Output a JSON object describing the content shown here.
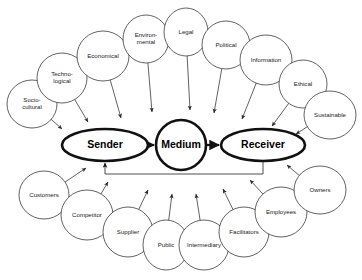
{
  "diagram": {
    "background_color": "#ffffff",
    "node_stroke_color": "#3a3a3a",
    "core_stroke_color": "#111111",
    "label_color": "#1a1a1a",
    "core": {
      "sender": {
        "label": "Sender",
        "cx": 105,
        "cy": 145,
        "rx": 43,
        "ry": 16
      },
      "medium": {
        "label": "Medium",
        "cx": 181,
        "cy": 145,
        "rx": 25,
        "ry": 25
      },
      "receiver": {
        "label": "Receiver",
        "cx": 263,
        "cy": 145,
        "rx": 42,
        "ry": 16
      }
    },
    "upper_arc": {
      "description": "Macro environment factors feeding into the sender and receiver",
      "nodes": [
        {
          "label_lines": [
            "Socio-",
            "cultural"
          ],
          "cx": 32,
          "cy": 104,
          "rx": 25,
          "ry": 24,
          "target_x": 62,
          "target_y": 129
        },
        {
          "label_lines": [
            "Techno-",
            "logical"
          ],
          "cx": 62,
          "cy": 78,
          "rx": 25,
          "ry": 25,
          "target_x": 88,
          "target_y": 122
        },
        {
          "label_lines": [
            "Economical"
          ],
          "cx": 103,
          "cy": 56,
          "rx": 26,
          "ry": 25,
          "target_x": 121,
          "target_y": 118
        },
        {
          "label_lines": [
            "Environ-",
            "mental"
          ],
          "cx": 146,
          "cy": 39,
          "rx": 23,
          "ry": 24,
          "target_x": 152,
          "target_y": 112
        },
        {
          "label_lines": [
            "Legal"
          ],
          "cx": 186,
          "cy": 32,
          "rx": 22,
          "ry": 24,
          "target_x": 190,
          "target_y": 110
        },
        {
          "label_lines": [
            "Political"
          ],
          "cx": 226,
          "cy": 45,
          "rx": 24,
          "ry": 24,
          "target_x": 214,
          "target_y": 113
        },
        {
          "label_lines": [
            "Information"
          ],
          "cx": 266,
          "cy": 60,
          "rx": 26,
          "ry": 25,
          "target_x": 242,
          "target_y": 119
        },
        {
          "label_lines": [
            "Ethical"
          ],
          "cx": 303,
          "cy": 84,
          "rx": 24,
          "ry": 24,
          "target_x": 272,
          "target_y": 126
        },
        {
          "label_lines": [
            "Sustainable"
          ],
          "cx": 330,
          "cy": 115,
          "rx": 26,
          "ry": 24,
          "target_x": 296,
          "target_y": 134
        }
      ]
    },
    "lower_arc": {
      "description": "Stakeholder groups feeding back into the sender and receiver",
      "nodes": [
        {
          "label_lines": [
            "Customers"
          ],
          "cx": 44,
          "cy": 195,
          "rx": 25,
          "ry": 24,
          "target_x": 86,
          "target_y": 168
        },
        {
          "label_lines": [
            "Competitor"
          ],
          "cx": 87,
          "cy": 215,
          "rx": 26,
          "ry": 25,
          "target_x": 108,
          "target_y": 182
        },
        {
          "label_lines": [
            "Supplier"
          ],
          "cx": 128,
          "cy": 232,
          "rx": 25,
          "ry": 25,
          "target_x": 148,
          "target_y": 190
        },
        {
          "label_lines": [
            "Public"
          ],
          "cx": 166,
          "cy": 245,
          "rx": 23,
          "ry": 25,
          "target_x": 172,
          "target_y": 194
        },
        {
          "label_lines": [
            "Intermediary"
          ],
          "cx": 204,
          "cy": 245,
          "rx": 25,
          "ry": 25,
          "target_x": 196,
          "target_y": 194
        },
        {
          "label_lines": [
            "Facilitators"
          ],
          "cx": 244,
          "cy": 232,
          "rx": 25,
          "ry": 25,
          "target_x": 223,
          "target_y": 189
        },
        {
          "label_lines": [
            "Employees"
          ],
          "cx": 281,
          "cy": 212,
          "rx": 26,
          "ry": 25,
          "target_x": 250,
          "target_y": 180
        },
        {
          "label_lines": [
            "Owners"
          ],
          "cx": 320,
          "cy": 190,
          "rx": 26,
          "ry": 24,
          "target_x": 287,
          "target_y": 165
        }
      ]
    },
    "flows": [
      {
        "name": "sender-to-medium",
        "from": "Sender",
        "to": "Medium",
        "x1": 149,
        "y1": 145,
        "x2": 154,
        "y2": 145
      },
      {
        "name": "medium-to-receiver",
        "from": "Medium",
        "to": "Receiver",
        "x1": 207,
        "y1": 145,
        "x2": 219,
        "y2": 145
      }
    ],
    "feedback": {
      "name": "feedback-loop",
      "from": "Receiver",
      "to": "Sender",
      "down_x": 263,
      "down_y1": 161,
      "down_y2": 174,
      "across_x": 105,
      "up_y": 163
    }
  }
}
